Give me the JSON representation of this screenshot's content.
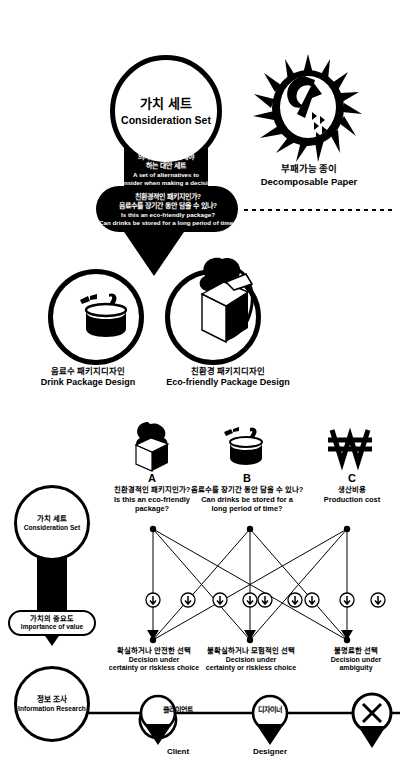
{
  "top": {
    "consideration": {
      "kr": "가치 세트",
      "en": "Consideration Set"
    },
    "alternatives": {
      "kr_line1": "의사결정시 고려해야",
      "kr_line2": "하는 대안 세트",
      "en_line1": "A set of alternatives to",
      "en_line2": "consider when making a decision"
    },
    "questions": {
      "kr_line1": "친환경적인 패키지인가?",
      "kr_line2": "음료수를 장기간 동안 담을 수 있나?",
      "en_line1": "Is this an eco-friendly package?",
      "en_line2": "Can drinks be stored for a long period of time?"
    },
    "paper": {
      "kr": "부패가능 종이",
      "en": "Decomposable Paper",
      "icon": "sunburst-paper-icon"
    },
    "drink_package": {
      "kr": "음료수 패키지디자인",
      "en": "Drink Package Design",
      "icon": "drink-can-icon"
    },
    "eco_package": {
      "kr": "친환경 패키지디자인",
      "en": "Eco-friendly Package Design",
      "icon": "tree-in-box-icon"
    }
  },
  "lower": {
    "consideration": {
      "kr": "가치 세트",
      "en": "Consideration Set"
    },
    "importance": {
      "kr": "가치의 중요도",
      "en": "Importance of value"
    },
    "research": {
      "kr": "정보 조사",
      "en": "Information Research"
    },
    "options": [
      {
        "letter": "A",
        "kr": "친환경적인 패키지인가?",
        "en_line1": "Is this an eco-friendly",
        "en_line2": "package?",
        "icon": "tree-in-box-icon"
      },
      {
        "letter": "B",
        "kr": "음료수를 장기간 동안 담을 수 있나?",
        "en_line1": "Can drinks be stored for a",
        "en_line2": "long period of time?",
        "icon": "drink-can-icon"
      },
      {
        "letter": "C",
        "kr": "생산비용",
        "en_line1": "Production cost",
        "en_line2": "",
        "icon": "won-currency-icon"
      }
    ],
    "outcomes": [
      {
        "kr": "확실하거나 안전한 선택",
        "en_line1": "Decision under",
        "en_line2": "certainty or riskless choice"
      },
      {
        "kr": "불확실하거나 모험적인 선택",
        "en_line1": "Decision under",
        "en_line2": "certainty or riskless choice"
      },
      {
        "kr": "불명료한 선택",
        "en_line1": "Decision under",
        "en_line2": "ambiguity"
      }
    ],
    "timeline": [
      {
        "kr": "클라이언트",
        "en": "Client",
        "icon": "map-pin-icon"
      },
      {
        "kr": "디자이너",
        "en": "Designer",
        "icon": "map-pin-icon"
      },
      {
        "kr": "",
        "en": "",
        "icon": "x-pin-icon"
      }
    ],
    "node_icon": "down-arrow-node-icon"
  },
  "colors": {
    "ink": "#000000",
    "paper": "#ffffff"
  }
}
